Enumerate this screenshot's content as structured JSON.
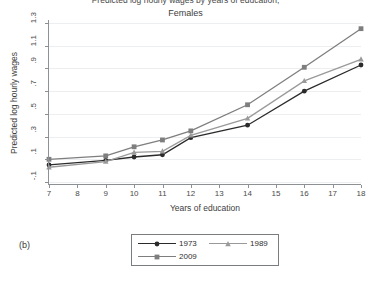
{
  "figure": {
    "title": "Predicted log hourly wages by years of education,",
    "subtitle": "Females",
    "panel_label": "(b)"
  },
  "axes": {
    "x_title": "Years of education",
    "y_title": "Predicted log hourly wages",
    "x_ticks": [
      "7",
      "8",
      "9",
      "10",
      "11",
      "12",
      "13",
      "14",
      "15",
      "16",
      "17",
      "18"
    ],
    "y_ticks": [
      "-.1",
      ".1",
      ".3",
      ".5",
      ".7",
      ".9",
      "1.1",
      "1.3"
    ]
  },
  "legend": {
    "items": [
      {
        "label": "1973",
        "color": "#2b2b2b",
        "marker": "circle"
      },
      {
        "label": "1989",
        "color": "#9a9a9a",
        "marker": "triangle"
      },
      {
        "label": "2009",
        "color": "#7e7e7e",
        "marker": "square"
      }
    ]
  },
  "chart_data": {
    "type": "line",
    "title": "Predicted log hourly wages by years of education,",
    "subtitle": "Females",
    "xlabel": "Years of education",
    "ylabel": "Predicted log hourly wages",
    "xlim": [
      7,
      18
    ],
    "ylim": [
      -0.1,
      1.3
    ],
    "xticks": [
      7,
      8,
      9,
      10,
      11,
      12,
      13,
      14,
      15,
      16,
      17,
      18
    ],
    "yticks": [
      -0.1,
      0.1,
      0.3,
      0.5,
      0.7,
      0.9,
      1.1,
      1.3
    ],
    "grid": "horizontal",
    "legend_position": "bottom-center",
    "x": [
      7,
      9,
      10,
      11,
      12,
      14,
      16,
      18
    ],
    "series": [
      {
        "name": "1973",
        "color": "#2b2b2b",
        "marker": "circle",
        "values": [
          0.05,
          0.09,
          0.12,
          0.14,
          0.29,
          0.4,
          0.7,
          0.93
        ]
      },
      {
        "name": "1989",
        "color": "#9a9a9a",
        "marker": "triangle",
        "values": [
          0.03,
          0.08,
          0.16,
          0.17,
          0.31,
          0.46,
          0.79,
          0.98
        ]
      },
      {
        "name": "2009",
        "color": "#7e7e7e",
        "marker": "square",
        "values": [
          0.1,
          0.13,
          0.21,
          0.27,
          0.35,
          0.58,
          0.91,
          1.25
        ]
      }
    ]
  }
}
